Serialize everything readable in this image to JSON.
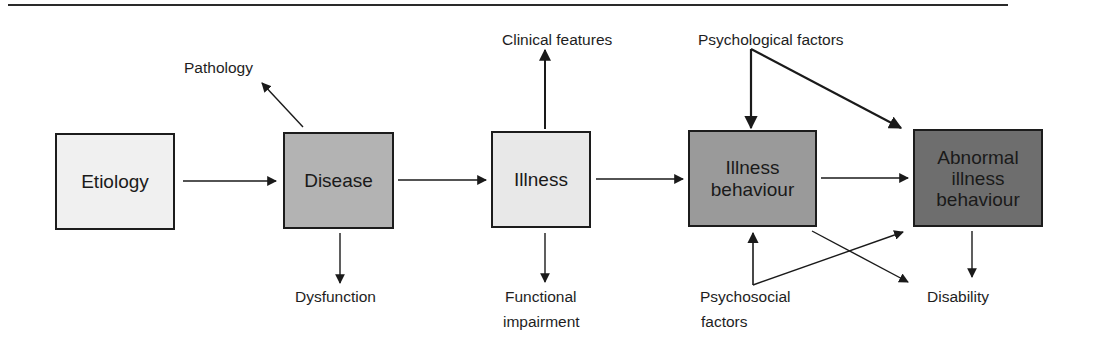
{
  "diagram": {
    "boxes": [
      {
        "id": "etiology",
        "label": "Etiology",
        "fill": "#f0f0f0"
      },
      {
        "id": "disease",
        "label": "Disease",
        "fill": "#b3b3b3"
      },
      {
        "id": "illness",
        "label": "Illness",
        "fill": "#e8e8e8"
      },
      {
        "id": "illness_behaviour",
        "label_line1": "Illness",
        "label_line2": "behaviour",
        "fill": "#9a9a9a"
      },
      {
        "id": "abnormal_illness_behaviour",
        "label_line1": "Abnormal",
        "label_line2": "illness",
        "label_line3": "behaviour",
        "fill": "#6e6e6e"
      }
    ],
    "outcome_labels": {
      "pathology": "Pathology",
      "dysfunction": "Dysfunction",
      "clinical_features": "Clinical features",
      "functional_impairment_line1": "Functional",
      "functional_impairment_line2": "impairment",
      "psychological_factors": "Psychological factors",
      "psychosocial_factors_line1": "Psychosocial",
      "psychosocial_factors_line2": "factors",
      "disability": "Disability"
    },
    "edges": [
      {
        "from": "Etiology",
        "to": "Disease"
      },
      {
        "from": "Disease",
        "to": "Illness"
      },
      {
        "from": "Illness",
        "to": "Illness behaviour"
      },
      {
        "from": "Illness behaviour",
        "to": "Abnormal illness behaviour"
      },
      {
        "from": "Disease",
        "to": "Pathology"
      },
      {
        "from": "Disease",
        "to": "Dysfunction"
      },
      {
        "from": "Illness",
        "to": "Clinical features"
      },
      {
        "from": "Illness",
        "to": "Functional impairment"
      },
      {
        "from": "Psychological factors",
        "to": "Illness behaviour"
      },
      {
        "from": "Psychological factors",
        "to": "Abnormal illness behaviour"
      },
      {
        "from": "Psychosocial factors",
        "to": "Illness behaviour"
      },
      {
        "from": "Psychosocial factors",
        "to": "Abnormal illness behaviour"
      },
      {
        "from": "Illness behaviour",
        "to": "Disability"
      },
      {
        "from": "Abnormal illness behaviour",
        "to": "Disability"
      }
    ]
  }
}
